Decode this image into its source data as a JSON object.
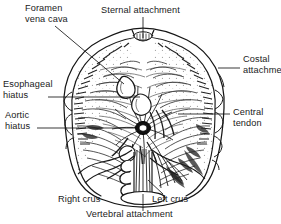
{
  "figure": {
    "view": "from below",
    "line_color": "#1a1a1a",
    "fill_color": "#ffffff",
    "background": "#ffffff"
  },
  "labels": {
    "foramen_vena_cava": "Foramen\nvena cava",
    "sternal_attachment": "Sternal attachment",
    "costal_attachment": "Costal\nattachment",
    "esophageal_hiatus": "Esophageal\nhiatus",
    "aortic_hiatus": "Aortic\nhiatus",
    "central_tendon": "Central\ntendon",
    "right_crus": "Right crus",
    "left_crus": "Left crus",
    "vertebral_attachment": "Vertebral attachment"
  },
  "structures": [
    {
      "name": "foramen-vena-cava",
      "label": "Foramen vena cava"
    },
    {
      "name": "sternal-attachment",
      "label": "Sternal attachment"
    },
    {
      "name": "costal-attachment",
      "label": "Costal attachment"
    },
    {
      "name": "esophageal-hiatus",
      "label": "Esophageal hiatus"
    },
    {
      "name": "aortic-hiatus",
      "label": "Aortic hiatus"
    },
    {
      "name": "central-tendon",
      "label": "Central tendon"
    },
    {
      "name": "right-crus",
      "label": "Right crus"
    },
    {
      "name": "left-crus",
      "label": "Left crus"
    },
    {
      "name": "vertebral-attachment",
      "label": "Vertebral attachment"
    }
  ]
}
